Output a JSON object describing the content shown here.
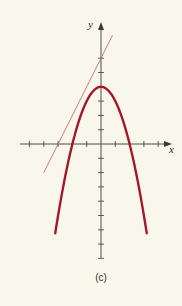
{
  "chart_data": {
    "type": "line",
    "title": "",
    "caption": "(c)",
    "xlabel": "x",
    "ylabel": "y",
    "xlim": [
      -6,
      5
    ],
    "ylim": [
      -8,
      7
    ],
    "grid": false,
    "legend": null,
    "x_ticks": [
      -5,
      -4,
      -3,
      -2,
      -1,
      1,
      2,
      3,
      4
    ],
    "y_ticks": [
      -8,
      -7,
      -6,
      -5,
      -4,
      -3,
      -2,
      -1,
      1,
      2,
      3,
      4,
      5,
      6
    ],
    "series": [
      {
        "name": "parabola",
        "equation": "y = 4 - x^2",
        "color": "#a3192b",
        "x": [
          -3.2,
          -3,
          -2.5,
          -2,
          -1.5,
          -1,
          -0.5,
          0,
          0.5,
          1,
          1.5,
          2,
          2.5,
          3,
          3.2
        ],
        "y": [
          -6.24,
          -5,
          -2.25,
          0,
          1.75,
          3,
          3.75,
          4,
          3.75,
          3,
          1.75,
          0,
          -2.25,
          -5,
          -6.24
        ]
      },
      {
        "name": "tangent line",
        "equation": "y = 2x + 6",
        "color": "#c46a74",
        "x": [
          -4,
          -3,
          -1,
          0,
          0.8
        ],
        "y": [
          -2,
          0,
          4,
          6,
          7.6
        ]
      }
    ],
    "annotations": {
      "vertex": [
        0,
        4
      ],
      "x_intercepts_parabola": [
        -2,
        2
      ],
      "tangent_y_intercept": 6,
      "tangent_x_intercept": -3
    }
  },
  "colors": {
    "background": "#f9f6ec",
    "axis": "#3a3a3a",
    "curve": "#a3192b",
    "tangent": "#c46a74"
  },
  "labels": {
    "x": "x",
    "y": "y",
    "caption": "(c)"
  }
}
